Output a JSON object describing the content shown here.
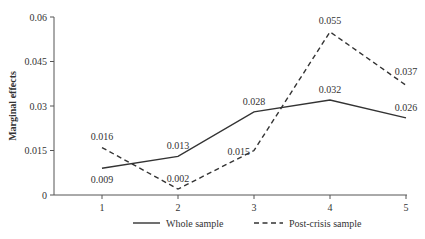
{
  "chart_data": {
    "type": "line",
    "title": "",
    "xlabel": "",
    "ylabel": "Marginal effects",
    "categories": [
      "1",
      "2",
      "3",
      "4",
      "5"
    ],
    "x": [
      1,
      2,
      3,
      4,
      5
    ],
    "ylim": [
      0,
      0.06
    ],
    "yticks": [
      0,
      0.015,
      0.03,
      0.045,
      0.06
    ],
    "ytick_labels": [
      "0",
      "0.015",
      "0.03",
      "0.045",
      "0.06"
    ],
    "grid": false,
    "legend_position": "bottom",
    "series": [
      {
        "name": "Whole sample",
        "style": "solid",
        "color": "#333333",
        "values": [
          0.009,
          0.013,
          0.028,
          0.032,
          0.026
        ],
        "labels": [
          "0.009",
          "0.013",
          "0.028",
          "0.032",
          "0.026"
        ]
      },
      {
        "name": "Post-crisis sample",
        "style": "dashed",
        "color": "#333333",
        "values": [
          0.016,
          0.002,
          0.015,
          0.055,
          0.037
        ],
        "labels": [
          "0.016",
          "0.002",
          "0.015",
          "0.055",
          "0.037"
        ]
      }
    ]
  }
}
